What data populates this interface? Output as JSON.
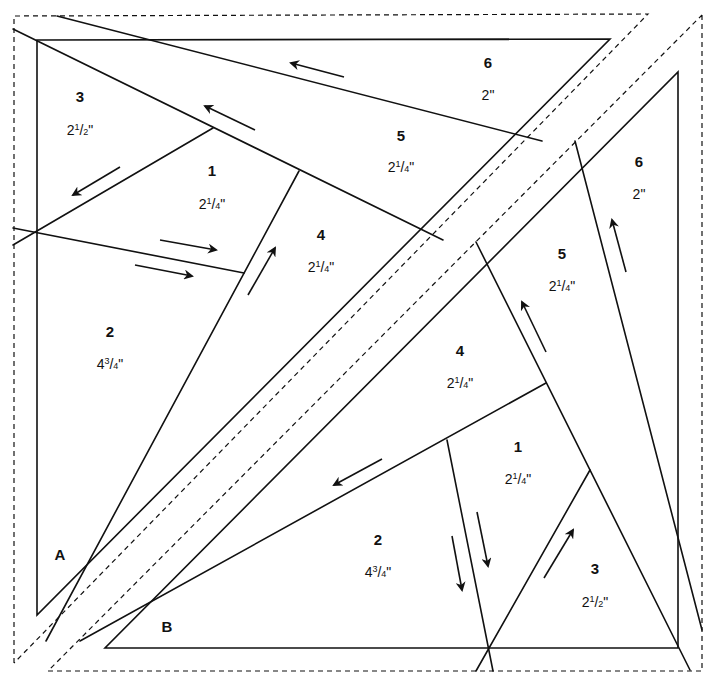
{
  "diagram": {
    "type": "foundation-paper-piecing-pattern",
    "sections": [
      {
        "label": "A",
        "pieces": [
          {
            "number": "1",
            "size_whole": "2",
            "size_num": "1",
            "size_den": "4",
            "size_suffix": "\""
          },
          {
            "number": "2",
            "size_whole": "4",
            "size_num": "3",
            "size_den": "4",
            "size_suffix": "\""
          },
          {
            "number": "3",
            "size_whole": "2",
            "size_num": "1",
            "size_den": "2",
            "size_suffix": "\""
          },
          {
            "number": "4",
            "size_whole": "2",
            "size_num": "1",
            "size_den": "4",
            "size_suffix": "\""
          },
          {
            "number": "5",
            "size_whole": "2",
            "size_num": "1",
            "size_den": "4",
            "size_suffix": "\""
          },
          {
            "number": "6",
            "size_whole": "2",
            "size_num": "",
            "size_den": "",
            "size_suffix": "\""
          }
        ]
      },
      {
        "label": "B",
        "pieces": [
          {
            "number": "1",
            "size_whole": "2",
            "size_num": "1",
            "size_den": "4",
            "size_suffix": "\""
          },
          {
            "number": "2",
            "size_whole": "4",
            "size_num": "3",
            "size_den": "4",
            "size_suffix": "\""
          },
          {
            "number": "3",
            "size_whole": "2",
            "size_num": "1",
            "size_den": "2",
            "size_suffix": "\""
          },
          {
            "number": "4",
            "size_whole": "2",
            "size_num": "1",
            "size_den": "4",
            "size_suffix": "\""
          },
          {
            "number": "5",
            "size_whole": "2",
            "size_num": "1",
            "size_den": "4",
            "size_suffix": "\""
          },
          {
            "number": "6",
            "size_whole": "2",
            "size_num": "",
            "size_den": "",
            "size_suffix": "\""
          }
        ]
      }
    ],
    "colors": {
      "line": "#111111",
      "background": "#ffffff"
    }
  }
}
